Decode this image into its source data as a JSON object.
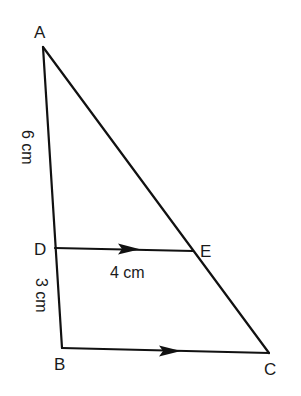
{
  "diagram": {
    "type": "geometry-figure",
    "points": {
      "A": "A",
      "B": "B",
      "C": "C",
      "D": "D",
      "E": "E"
    },
    "measurements": {
      "AD": "6 cm",
      "DB": "3 cm",
      "DE": "4 cm"
    },
    "parallel_marks": [
      "DE",
      "BC"
    ],
    "colors": {
      "line": "#111111",
      "background": "#ffffff"
    }
  }
}
